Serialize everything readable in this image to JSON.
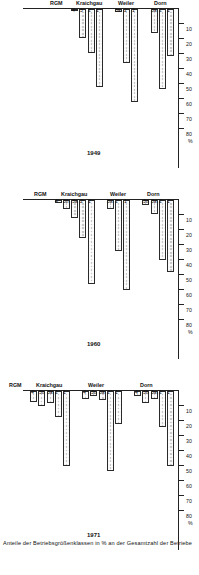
{
  "figure": {
    "axis_title": "Anteile der Betriebsgrößenklassen in % an der Gesamtzahl der Betriebe",
    "percent_symbol": "%",
    "rgm_label": "RGM"
  },
  "axis": {
    "ticks": [
      "10",
      "20",
      "30",
      "40",
      "50",
      "60",
      "70",
      "80"
    ],
    "unit": "%",
    "min": 0,
    "max": 85
  },
  "chart_data": {
    "type": "bar",
    "title": "Anteile der Betriebsgrößenklassen in % an der Gesamtzahl der Betriebe",
    "xlabel": "%",
    "ylabel": "Betriebsgrößenklassen",
    "xlim": [
      0,
      85
    ],
    "grid": false,
    "legend": "none",
    "orientation": "horizontal",
    "panels": [
      {
        "year": "1949",
        "groups": [
          {
            "name": "Dorn",
            "categories": [
              "1",
              "2",
              "3a"
            ],
            "values": [
              31,
              53,
              16
            ]
          },
          {
            "name": "Weiler",
            "categories": [
              "1",
              "2",
              "3a"
            ],
            "values": [
              62,
              36,
              2
            ]
          },
          {
            "name": "Kraichgau",
            "categories": [
              "1",
              "2",
              "3",
              "4"
            ],
            "values": [
              52,
              29,
              19,
              1
            ]
          }
        ]
      },
      {
        "year": "1960",
        "groups": [
          {
            "name": "Dorn",
            "categories": [
              "1",
              "2",
              "3a",
              "3b"
            ],
            "values": [
              48,
              40,
              9,
              3
            ]
          },
          {
            "name": "Weiler",
            "categories": [
              "1",
              "2",
              "3a"
            ],
            "values": [
              60,
              34,
              6
            ]
          },
          {
            "name": "Kraichgau",
            "categories": [
              "1",
              "2",
              "3a",
              "3b",
              "4"
            ],
            "values": [
              56,
              25,
              12,
              6,
              2
            ]
          }
        ]
      },
      {
        "year": "1971",
        "groups": [
          {
            "name": "Dorn",
            "categories": [
              "1",
              "2",
              "3a",
              "3b",
              "4"
            ],
            "values": [
              50,
              24,
              5,
              8,
              3
            ]
          },
          {
            "name": "Weiler",
            "categories": [
              "1",
              "2",
              "3a",
              "3b",
              "4"
            ],
            "values": [
              22,
              53,
              6,
              3,
              5
            ]
          },
          {
            "name": "Kraichgau",
            "categories": [
              "1",
              "2",
              "3a",
              "3b",
              "4"
            ],
            "values": [
              50,
              17,
              8,
              10,
              7
            ]
          }
        ]
      }
    ]
  }
}
